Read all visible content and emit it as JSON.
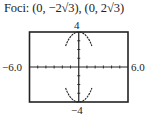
{
  "title": "Foci: (0, −2√3), (0, 2√3)",
  "chart_data": {
    "type": "line",
    "title": "Foci: (0, −2√3), (0, 2√3)",
    "equation": "x^2/4 + y^2/16 = 1",
    "xlabel": "",
    "ylabel": "",
    "xlim": [
      -6.0,
      6.0
    ],
    "ylim": [
      -4,
      4
    ],
    "tick_labels": {
      "xmin": "−6.0",
      "xmax": "6.0",
      "ymin": "−4",
      "ymax": "4"
    },
    "x_tick_step": 1,
    "y_tick_step": 1,
    "grid": false,
    "legend": null,
    "series": [
      {
        "name": "upper half",
        "x": [
          -1.6,
          -1.2,
          -0.8,
          -0.4,
          0,
          0.4,
          0.8,
          1.2,
          1.6
        ],
        "y": [
          2.4,
          3.2,
          3.67,
          3.92,
          4,
          3.92,
          3.67,
          3.2,
          2.4
        ]
      },
      {
        "name": "lower half",
        "x": [
          -1.6,
          -1.2,
          -0.8,
          -0.4,
          0,
          0.4,
          0.8,
          1.2,
          1.6
        ],
        "y": [
          -2.4,
          -3.2,
          -3.67,
          -3.92,
          -4,
          -3.92,
          -3.67,
          -3.2,
          -2.4
        ]
      }
    ],
    "vertices": [
      [
        0,
        4
      ],
      [
        0,
        -4
      ]
    ],
    "co_vertices": [
      [
        -2,
        0
      ],
      [
        2,
        0
      ]
    ],
    "foci": [
      [
        0,
        -3.464
      ],
      [
        0,
        3.464
      ]
    ]
  }
}
